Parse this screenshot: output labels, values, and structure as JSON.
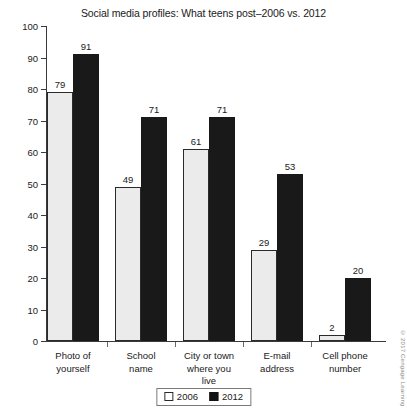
{
  "chart_data": {
    "type": "bar",
    "title": "Social media profiles: What teens post–2006 vs. 2012",
    "xlabel": "",
    "ylabel": "",
    "ylim": [
      0,
      100
    ],
    "y_ticks": [
      0,
      10,
      20,
      30,
      40,
      50,
      60,
      70,
      80,
      90,
      100
    ],
    "grid": false,
    "legend_position": "bottom-center",
    "categories": [
      "Photo of yourself",
      "School name",
      "City or town where you live",
      "E-mail address",
      "Cell phone number"
    ],
    "series": [
      {
        "name": "2006",
        "values": [
          79,
          49,
          61,
          29,
          2
        ],
        "color": "#ebebeb"
      },
      {
        "name": "2012",
        "values": [
          91,
          71,
          71,
          53,
          20
        ],
        "color": "#191919"
      }
    ]
  },
  "axis": {
    "tick_labels": [
      "100",
      "90",
      "80",
      "70",
      "60",
      "50",
      "40",
      "30",
      "20",
      "10",
      "0"
    ]
  },
  "category_labels": [
    [
      "Photo of",
      "yourself"
    ],
    [
      "School",
      "name"
    ],
    [
      "City or town",
      "where you",
      "live"
    ],
    [
      "E-mail",
      "address"
    ],
    [
      "Cell phone",
      "number"
    ]
  ],
  "legend": {
    "items": [
      {
        "label": "2006",
        "swatch": "light"
      },
      {
        "label": "2012",
        "swatch": "dark"
      }
    ]
  },
  "credit": "© 2017 Cengage Learning"
}
